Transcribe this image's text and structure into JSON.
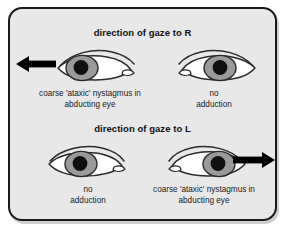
{
  "figure": {
    "panel_background": "#e8e8e8",
    "border_color": "#1a1a1a",
    "page_background": "#ffffff"
  },
  "colors": {
    "iris": "#9a9a9a",
    "iris_dark": "#8a8a8a",
    "pupil": "#101010",
    "sclera": "#ffffff",
    "outline": "#2b2b2b",
    "arrow": "#000000",
    "text": "#1a1a1a"
  },
  "sections": [
    {
      "id": "gaze-right",
      "title": "direction of gaze to R",
      "arrow_direction": "left",
      "eyes": [
        {
          "id": "top-left-eye",
          "position": "left",
          "iris_position": "left",
          "canthus_side": "right",
          "caption_line1": "coarse 'ataxic' nystagmus in",
          "caption_line2": "abducting eye",
          "has_arrow": true
        },
        {
          "id": "top-right-eye",
          "position": "right",
          "iris_position": "center",
          "canthus_side": "left",
          "caption_line1": "no",
          "caption_line2": "adduction",
          "has_arrow": false
        }
      ]
    },
    {
      "id": "gaze-left",
      "title": "direction of gaze to L",
      "arrow_direction": "right",
      "eyes": [
        {
          "id": "bottom-left-eye",
          "position": "left",
          "iris_position": "center",
          "canthus_side": "right",
          "caption_line1": "no",
          "caption_line2": "adduction",
          "has_arrow": false
        },
        {
          "id": "bottom-right-eye",
          "position": "right",
          "iris_position": "right",
          "canthus_side": "left",
          "caption_line1": "coarse 'ataxic' nystagmus in",
          "caption_line2": "abducting eye",
          "has_arrow": true
        }
      ]
    }
  ],
  "icons": {
    "arrow_left": "left-arrow-icon",
    "arrow_right": "right-arrow-icon",
    "eye": "eye-icon"
  }
}
